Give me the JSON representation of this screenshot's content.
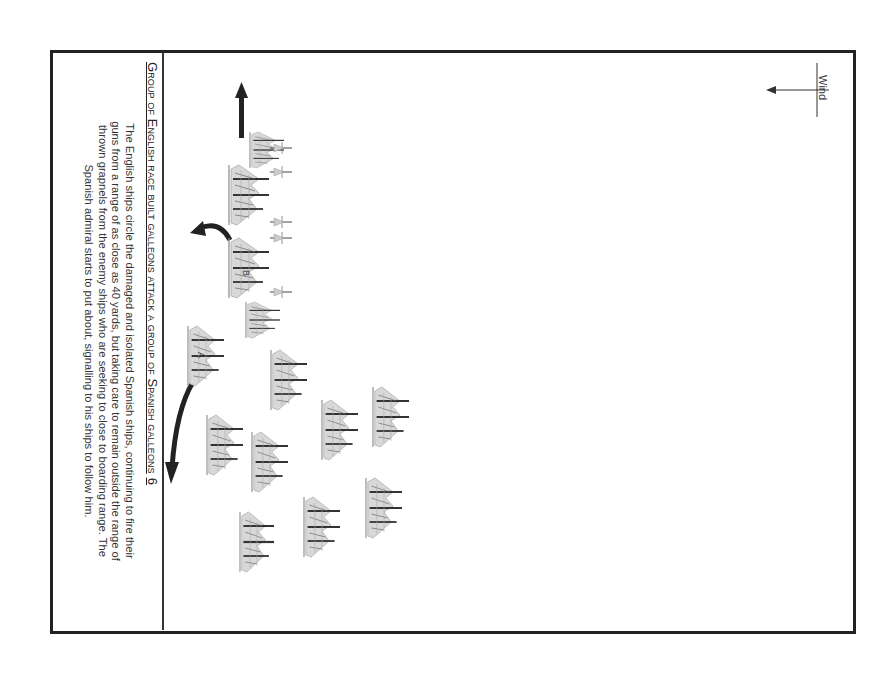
{
  "diagram": {
    "orientation": "rotated-90-clockwise",
    "caption": {
      "title": "Group of English race built galleons attack a group of Spanish galleons",
      "number": "6",
      "body_lines": [
        "The English ships circle the damaged and isolated Spanish ships, continuing to fire their",
        "guns from a range of as close as 40 yards, but taking care to remain outside the range of",
        "thrown grapnels from the enemy ships who are seeking to close to boarding range. The",
        "Spanish admiral starts to put about, signalling to his ships to follow him."
      ]
    },
    "wind": {
      "label": "Wind",
      "icon": "wind-direction-arrow-icon"
    },
    "ship_labels": {
      "a": "A",
      "b": "B"
    },
    "colors": {
      "ink": "#222222",
      "ship_gray": "#7a7a7a",
      "background": "#ffffff"
    }
  }
}
